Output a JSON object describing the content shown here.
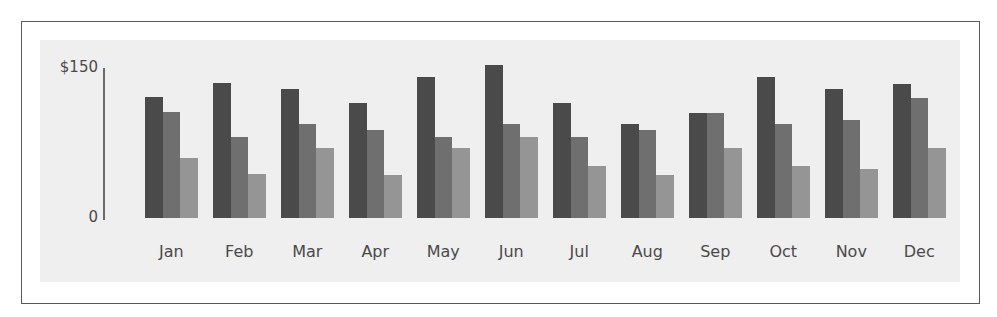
{
  "chart_data": {
    "type": "bar",
    "title": "",
    "xlabel": "",
    "ylabel": "",
    "ylim": [
      0,
      150
    ],
    "y_ticks": [
      "0",
      "$150"
    ],
    "grid": false,
    "legend": null,
    "categories": [
      "Jan",
      "Feb",
      "Mar",
      "Apr",
      "May",
      "Jun",
      "Jul",
      "Aug",
      "Sep",
      "Oct",
      "Nov",
      "Dec"
    ],
    "series": [
      {
        "name": "Series 1",
        "color": "#4a4a4a",
        "values": [
          121,
          135,
          129,
          115,
          141,
          153,
          115,
          94,
          105,
          141,
          129,
          134
        ]
      },
      {
        "name": "Series 2",
        "color": "#6f6f6f",
        "values": [
          106,
          81,
          94,
          88,
          81,
          94,
          81,
          88,
          105,
          94,
          98,
          120
        ]
      },
      {
        "name": "Series 3",
        "color": "#959595",
        "values": [
          60,
          44,
          70,
          43,
          70,
          81,
          52,
          43,
          70,
          52,
          49,
          70
        ]
      }
    ]
  },
  "axis": {
    "y_top_label": "$150",
    "y_bottom_label": "0"
  },
  "colors": {
    "panel_bg": "#efefef",
    "frame_border": "#5a5a5a",
    "series_dark": "#4a4a4a",
    "series_mid": "#6f6f6f",
    "series_light": "#959595"
  }
}
